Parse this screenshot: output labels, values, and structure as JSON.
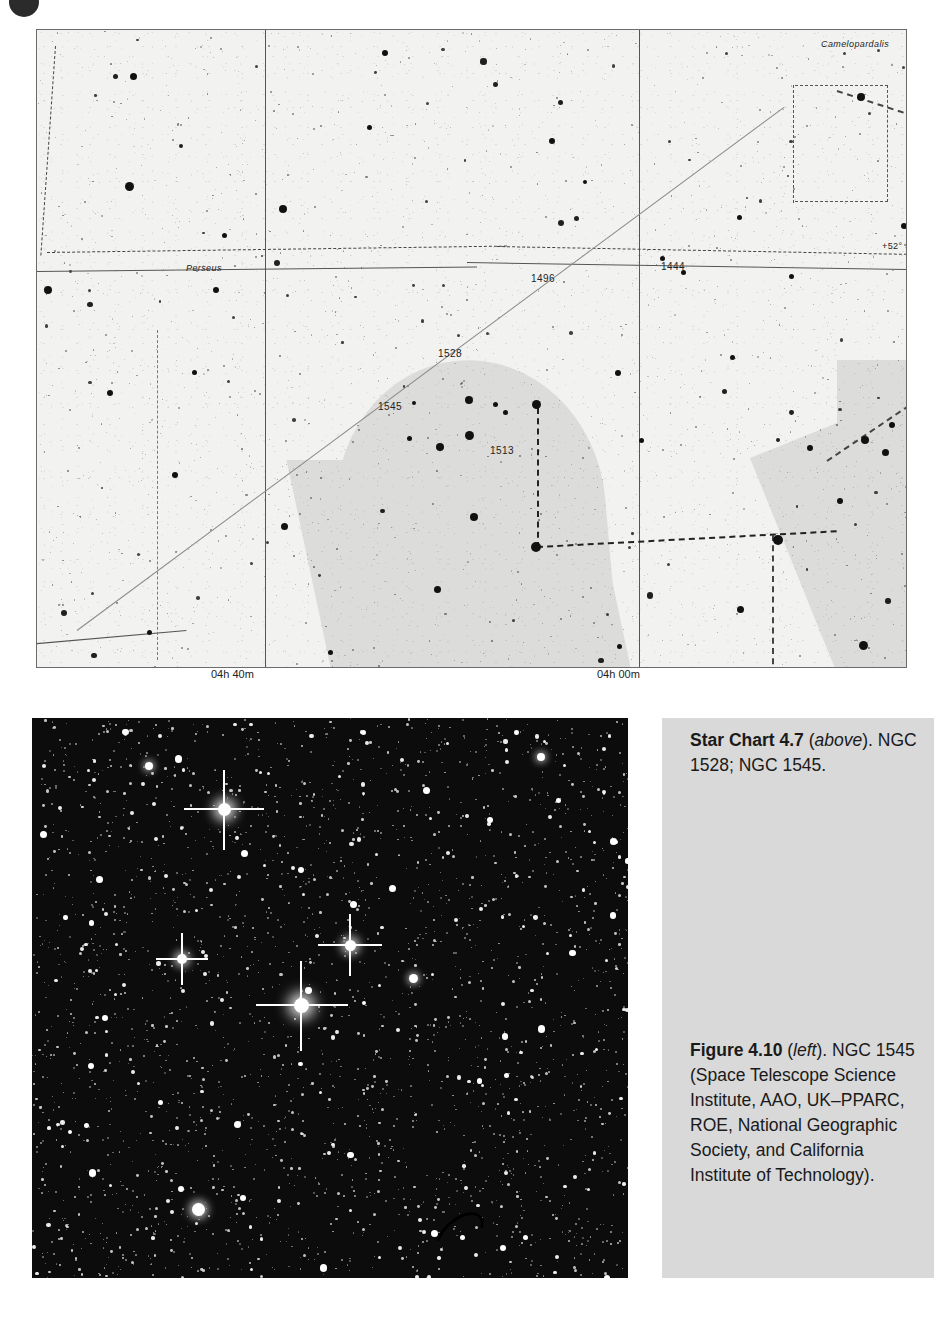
{
  "page": {
    "bullet_icon": "page-number-bullet"
  },
  "star_chart": {
    "name": "Star Chart 4.7",
    "constellation_label": "Camelopardalis",
    "constellation_label_2": "Perseus",
    "declination_label": "+52° 30'",
    "object_labels": [
      {
        "id": "1528",
        "text": "1528"
      },
      {
        "id": "1545",
        "text": "1545"
      },
      {
        "id": "1513",
        "text": "1513"
      },
      {
        "id": "1496",
        "text": "1496"
      },
      {
        "id": "1444",
        "text": "1444"
      }
    ],
    "ra_axis": [
      {
        "text": "04h 40m"
      },
      {
        "text": "04h 00m"
      }
    ],
    "colors": {
      "sky": "#f2f2f0",
      "milky_way": "#dcdcda",
      "border": "#6b6b6b",
      "star": "#111111"
    }
  },
  "chart_data": {
    "type": "scatter",
    "title": "Star Chart 4.7",
    "xlabel": "Right Ascension",
    "ylabel": "Declination",
    "xticks": [
      "04h 40m",
      "04h 00m"
    ],
    "yticks": [
      "+52° 30'"
    ],
    "grid": true,
    "legend": null,
    "annotations": [
      {
        "label": "Camelopardalis",
        "type": "constellation-name"
      },
      {
        "label": "Perseus",
        "type": "constellation-name"
      },
      {
        "label": "1528",
        "type": "ngc-cluster"
      },
      {
        "label": "1545",
        "type": "ngc-cluster"
      },
      {
        "label": "1513",
        "type": "ngc-cluster"
      },
      {
        "label": "1496",
        "type": "ngc-cluster"
      },
      {
        "label": "1444",
        "type": "ngc-cluster"
      },
      {
        "label": "+52° 30'",
        "type": "declination-circle"
      }
    ],
    "features": [
      "milky-way-band",
      "constellation-boundaries",
      "ecliptic-line",
      "constellation-figure-lines"
    ]
  },
  "photograph": {
    "name": "Figure 4.10",
    "subject": "NGC 1545 open cluster field",
    "background_color": "#0c0c0c",
    "star_color": "#ffffff"
  },
  "captions": {
    "chart": {
      "title": "Star Chart 4.7",
      "position_note": "above",
      "body_before": " (",
      "body_after": "). NGC 1528; NGC 1545."
    },
    "figure": {
      "title": "Figure 4.10",
      "position_note": "left",
      "body_before": " (",
      "body_after": "). NGC 1545 (Space Telescope Science Institute, AAO, UK–PPARC, ROE, National Geographic Society, and California Institute of Technology)."
    }
  }
}
